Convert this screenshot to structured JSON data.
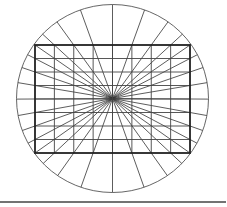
{
  "diagram": {
    "title": "",
    "grid": {
      "columns": 8,
      "rows": 8
    },
    "rays": {
      "source": "center",
      "through": "boundary-grid-points",
      "extend_to": "circle"
    },
    "colors": {
      "background": "#ffffff",
      "circle": "#555555",
      "rectangle": "#222222",
      "grid": "#444444",
      "rays": "#333333",
      "baseline": "#444444"
    }
  }
}
